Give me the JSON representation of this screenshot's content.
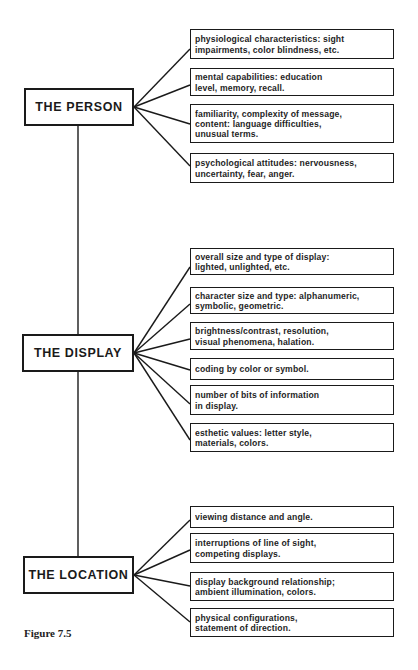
{
  "figure": {
    "caption": "Figure 7.5",
    "colors": {
      "line": "#1a1a1a",
      "background": "#ffffff",
      "text": "#1e1e1e"
    }
  },
  "groups": [
    {
      "label": "THE PERSON",
      "items": [
        "physiological characteristics: sight\nimpairments, color blindness, etc.",
        "mental capabilities: education\nlevel, memory, recall.",
        "familiarity, complexity of message,\ncontent: language difficulties,\nunusual terms.",
        "psychological attitudes: nervousness,\nuncertainty, fear, anger."
      ]
    },
    {
      "label": "THE DISPLAY",
      "items": [
        "overall size and type of display:\nlighted, unlighted, etc.",
        "character size and type: alphanumeric,\nsymbolic, geometric.",
        "brightness/contrast, resolution,\nvisual phenomena, halation.",
        "coding by color or symbol.",
        "number of bits of information\nin display.",
        "esthetic values: letter style,\nmaterials, colors."
      ]
    },
    {
      "label": "THE LOCATION",
      "items": [
        "viewing distance and angle.",
        "interruptions of line of sight,\ncompeting displays.",
        "display background relationship;\nambient illumination, colors.",
        "physical configurations,\nstatement of direction."
      ]
    }
  ]
}
